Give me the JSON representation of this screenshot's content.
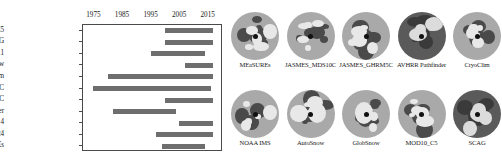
{
  "chart_data": {
    "type": "bar",
    "orientation": "horizontal",
    "subtype": "gantt-timeline",
    "title": "",
    "xlabel": "",
    "ylabel": "",
    "xlim": [
      1971,
      2020
    ],
    "grid": false,
    "legend": "none",
    "bar_color": "#6e6e6e",
    "xticks": [
      1975,
      1985,
      1995,
      2005,
      2015
    ],
    "xtick_labels": [
      "1975",
      "1985",
      "1995",
      "2005",
      "2015"
    ],
    "categories": [
      "MOD10_C5",
      "SCAG",
      "GloBSnow v2.1",
      "AutoSnow",
      "CryoClim",
      "JASMES GHRM5C",
      "JASMES MDS10C",
      "AVHRR Pathfinder",
      "NOAA IMS 4",
      "NOAA IMS 24",
      "MEaSUREs"
    ],
    "spans": [
      {
        "label": "MOD10_C5",
        "start": 2000,
        "end": 2017
      },
      {
        "label": "SCAG",
        "start": 2000,
        "end": 2017
      },
      {
        "label": "GloBSnow v2.1",
        "start": 1995,
        "end": 2014
      },
      {
        "label": "AutoSnow",
        "start": 2007,
        "end": 2017
      },
      {
        "label": "CryoClim",
        "start": 1980,
        "end": 2017
      },
      {
        "label": "JASMES GHRM5C",
        "start": 1975,
        "end": 2016
      },
      {
        "label": "JASMES MDS10C",
        "start": 2000,
        "end": 2017
      },
      {
        "label": "AVHRR Pathfinder",
        "start": 1982,
        "end": 2004
      },
      {
        "label": "NOAA IMS 4",
        "start": 2005,
        "end": 2017
      },
      {
        "label": "NOAA IMS 24",
        "start": 1997,
        "end": 2017
      },
      {
        "label": "MEaSUREs",
        "start": 1999,
        "end": 2014
      }
    ]
  },
  "maps": {
    "rows": [
      {
        "cells": [
          {
            "label": "MEaSUREs",
            "style": "light"
          },
          {
            "label": "JASMES_MDS10C",
            "style": "light"
          },
          {
            "label": "JASMES_GHRM5C",
            "style": "light"
          },
          {
            "label": "AVHRR Pathfinder",
            "style": "dark"
          },
          {
            "label": "CryoClim",
            "style": "light"
          }
        ]
      },
      {
        "cells": [
          {
            "label": "NOAA IMS",
            "style": "light"
          },
          {
            "label": "AutoSnow",
            "style": "light"
          },
          {
            "label": "GlobSnow",
            "style": "light"
          },
          {
            "label": "MOD10_C5",
            "style": "light"
          },
          {
            "label": "SCAG",
            "style": "dark"
          }
        ]
      }
    ]
  }
}
